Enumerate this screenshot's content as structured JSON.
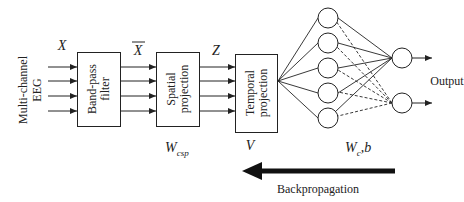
{
  "diagram": {
    "input_label": "Multi-channel EEG",
    "input_label_lines": [
      "Multi-channel",
      "EEG"
    ],
    "signals": {
      "x": "X",
      "x_bar": "X",
      "z": "Z"
    },
    "blocks": [
      {
        "id": "band-pass-filter",
        "lines": [
          "Band-pass",
          "filter"
        ]
      },
      {
        "id": "spatial-projection",
        "lines": [
          "Spatial",
          "projection"
        ]
      },
      {
        "id": "temporal-projection",
        "lines": [
          "Temporal",
          "projection"
        ]
      }
    ],
    "parameters": {
      "spatial": "W",
      "spatial_sub": "csp",
      "temporal": "V",
      "classifier": "W",
      "classifier_sub": "c",
      "classifier_bias": ",b"
    },
    "network": {
      "hidden_neurons": 5,
      "output_neurons": 2
    },
    "output_label": "Output",
    "backprop_label": "Backpropagation",
    "colors": {
      "stroke": "#222222",
      "background": "#ffffff"
    }
  }
}
